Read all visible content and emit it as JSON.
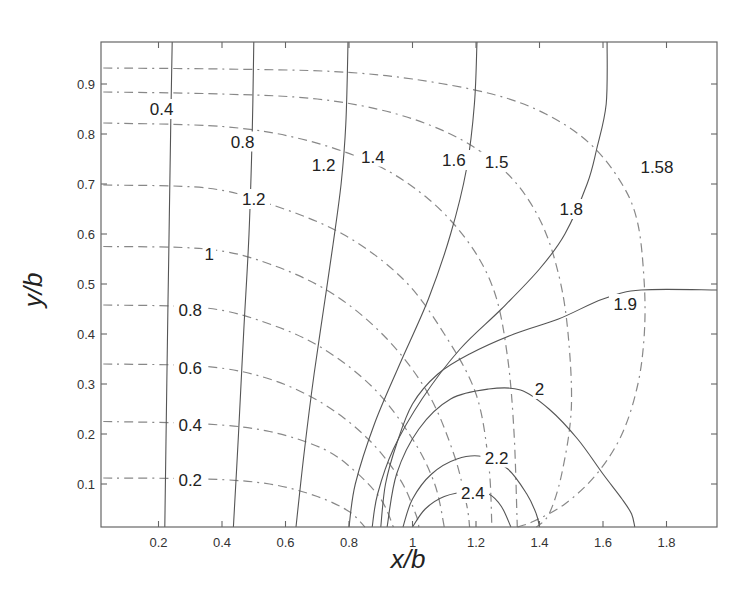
{
  "chart_data": {
    "type": "contour",
    "title": "",
    "xlabel": "x/b",
    "ylabel": "y/b",
    "xlim": [
      0.026,
      1.96
    ],
    "ylim": [
      0.014,
      0.984
    ],
    "grid": false,
    "legend": null,
    "xticks": [
      0.2,
      0.4,
      0.6,
      0.8,
      1,
      1.2,
      1.4,
      1.6,
      1.8
    ],
    "xtick_labels": [
      "0.2",
      "0.4",
      "0.6",
      "0.8",
      "1",
      "1.2",
      "1.4",
      "1.6",
      "1.8"
    ],
    "yticks": [
      0.1,
      0.2,
      0.3,
      0.4,
      0.5,
      0.6,
      0.7,
      0.8,
      0.9
    ],
    "ytick_labels": [
      "0.1",
      "0.2",
      "0.3",
      "0.4",
      "0.5",
      "0.6",
      "0.7",
      "0.8",
      "0.9"
    ],
    "solid_contours": [
      {
        "level": "0.4",
        "points": [
          [
            0.243,
            0.984
          ],
          [
            0.238,
            0.8
          ],
          [
            0.232,
            0.55
          ],
          [
            0.226,
            0.3
          ],
          [
            0.22,
            0.014
          ]
        ],
        "label_at": [
          0.21,
          0.85
        ]
      },
      {
        "level": "0.8",
        "points": [
          [
            0.5,
            0.984
          ],
          [
            0.495,
            0.8
          ],
          [
            0.485,
            0.6
          ],
          [
            0.468,
            0.4
          ],
          [
            0.452,
            0.2
          ],
          [
            0.436,
            0.014
          ]
        ],
        "label_at": [
          0.465,
          0.785
        ]
      },
      {
        "level": "1.2",
        "points": [
          [
            0.797,
            0.984
          ],
          [
            0.79,
            0.82
          ],
          [
            0.775,
            0.7
          ],
          [
            0.75,
            0.58
          ],
          [
            0.72,
            0.45
          ],
          [
            0.69,
            0.32
          ],
          [
            0.66,
            0.17
          ],
          [
            0.633,
            0.014
          ]
        ],
        "label_at": [
          0.72,
          0.738
        ]
      },
      {
        "level": "1.6",
        "points": [
          [
            1.203,
            0.984
          ],
          [
            1.195,
            0.86
          ],
          [
            1.17,
            0.73
          ],
          [
            1.12,
            0.6
          ],
          [
            1.05,
            0.47
          ],
          [
            0.96,
            0.34
          ],
          [
            0.88,
            0.22
          ],
          [
            0.82,
            0.1
          ],
          [
            0.8,
            0.014
          ]
        ],
        "label_at": [
          1.13,
          0.748
        ]
      },
      {
        "level": "1.8",
        "points": [
          [
            1.613,
            0.984
          ],
          [
            1.61,
            0.86
          ],
          [
            1.58,
            0.77
          ],
          [
            1.55,
            0.7
          ],
          [
            1.48,
            0.6
          ],
          [
            1.4,
            0.53
          ],
          [
            1.28,
            0.45
          ],
          [
            1.15,
            0.37
          ],
          [
            1.03,
            0.27
          ],
          [
            0.94,
            0.17
          ],
          [
            0.89,
            0.08
          ],
          [
            0.873,
            0.014
          ]
        ],
        "label_at": [
          1.5,
          0.65
        ]
      },
      {
        "level": "1.9",
        "points": [
          [
            1.96,
            0.488
          ],
          [
            1.72,
            0.488
          ],
          [
            1.6,
            0.47
          ],
          [
            1.46,
            0.43
          ],
          [
            1.32,
            0.4
          ],
          [
            1.18,
            0.36
          ],
          [
            1.08,
            0.32
          ],
          [
            1.0,
            0.26
          ],
          [
            0.95,
            0.18
          ],
          [
            0.915,
            0.1
          ],
          [
            0.9,
            0.014
          ]
        ],
        "label_at": [
          1.67,
          0.46
        ]
      },
      {
        "level": "2",
        "points": [
          [
            0.92,
            0.014
          ],
          [
            0.95,
            0.12
          ],
          [
            1.02,
            0.21
          ],
          [
            1.12,
            0.27
          ],
          [
            1.24,
            0.29
          ],
          [
            1.34,
            0.288
          ],
          [
            1.43,
            0.25
          ],
          [
            1.52,
            0.19
          ],
          [
            1.6,
            0.12
          ],
          [
            1.66,
            0.07
          ],
          [
            1.69,
            0.04
          ],
          [
            1.7,
            0.014
          ]
        ],
        "label_at": [
          1.4,
          0.29
        ]
      },
      {
        "level": "2.2",
        "points": [
          [
            0.97,
            0.014
          ],
          [
            1.0,
            0.07
          ],
          [
            1.06,
            0.12
          ],
          [
            1.14,
            0.15
          ],
          [
            1.22,
            0.155
          ],
          [
            1.3,
            0.13
          ],
          [
            1.36,
            0.08
          ],
          [
            1.39,
            0.04
          ],
          [
            1.4,
            0.014
          ]
        ],
        "label_at": [
          1.265,
          0.153
        ]
      },
      {
        "level": "2.4",
        "points": [
          [
            1.0,
            0.014
          ],
          [
            1.04,
            0.05
          ],
          [
            1.1,
            0.075
          ],
          [
            1.18,
            0.085
          ],
          [
            1.24,
            0.08
          ],
          [
            1.28,
            0.055
          ],
          [
            1.31,
            0.014
          ]
        ],
        "label_at": [
          1.19,
          0.082
        ]
      }
    ],
    "dashed_contours": [
      {
        "level": "0.2",
        "points": [
          [
            0.026,
            0.112
          ],
          [
            0.35,
            0.11
          ],
          [
            0.55,
            0.1
          ],
          [
            0.7,
            0.075
          ],
          [
            0.8,
            0.045
          ],
          [
            0.85,
            0.014
          ]
        ],
        "label_at": [
          0.3,
          0.108
        ]
      },
      {
        "level": "0.4",
        "points": [
          [
            0.026,
            0.225
          ],
          [
            0.35,
            0.22
          ],
          [
            0.55,
            0.205
          ],
          [
            0.72,
            0.17
          ],
          [
            0.82,
            0.125
          ],
          [
            0.9,
            0.07
          ],
          [
            0.94,
            0.014
          ]
        ],
        "label_at": [
          0.3,
          0.218
        ]
      },
      {
        "level": "0.6",
        "points": [
          [
            0.026,
            0.34
          ],
          [
            0.35,
            0.335
          ],
          [
            0.55,
            0.31
          ],
          [
            0.72,
            0.26
          ],
          [
            0.86,
            0.19
          ],
          [
            0.96,
            0.11
          ],
          [
            1.01,
            0.04
          ],
          [
            1.02,
            0.014
          ]
        ],
        "label_at": [
          0.3,
          0.333
        ]
      },
      {
        "level": "0.8",
        "points": [
          [
            0.026,
            0.458
          ],
          [
            0.35,
            0.452
          ],
          [
            0.55,
            0.42
          ],
          [
            0.72,
            0.37
          ],
          [
            0.88,
            0.29
          ],
          [
            1.0,
            0.19
          ],
          [
            1.07,
            0.1
          ],
          [
            1.1,
            0.014
          ]
        ],
        "label_at": [
          0.3,
          0.448
        ]
      },
      {
        "level": "1",
        "points": [
          [
            0.026,
            0.575
          ],
          [
            0.35,
            0.57
          ],
          [
            0.55,
            0.54
          ],
          [
            0.75,
            0.48
          ],
          [
            0.92,
            0.39
          ],
          [
            1.05,
            0.28
          ],
          [
            1.13,
            0.16
          ],
          [
            1.17,
            0.06
          ],
          [
            1.18,
            0.014
          ]
        ],
        "label_at": [
          0.36,
          0.56
        ]
      },
      {
        "level": "1.2",
        "points": [
          [
            0.026,
            0.698
          ],
          [
            0.35,
            0.692
          ],
          [
            0.55,
            0.66
          ],
          [
            0.78,
            0.6
          ],
          [
            0.97,
            0.51
          ],
          [
            1.1,
            0.4
          ],
          [
            1.2,
            0.28
          ],
          [
            1.24,
            0.14
          ],
          [
            1.25,
            0.014
          ]
        ],
        "label_at": [
          0.5,
          0.67
        ]
      },
      {
        "level": "1.4",
        "points": [
          [
            0.026,
            0.822
          ],
          [
            0.4,
            0.815
          ],
          [
            0.65,
            0.79
          ],
          [
            0.88,
            0.74
          ],
          [
            1.05,
            0.67
          ],
          [
            1.18,
            0.58
          ],
          [
            1.26,
            0.48
          ],
          [
            1.3,
            0.35
          ],
          [
            1.32,
            0.2
          ],
          [
            1.33,
            0.014
          ]
        ],
        "label_at": [
          0.875,
          0.755
        ]
      },
      {
        "level": "1.5",
        "points": [
          [
            0.026,
            0.884
          ],
          [
            0.4,
            0.88
          ],
          [
            0.7,
            0.87
          ],
          [
            0.95,
            0.84
          ],
          [
            1.15,
            0.79
          ],
          [
            1.3,
            0.72
          ],
          [
            1.4,
            0.63
          ],
          [
            1.46,
            0.52
          ],
          [
            1.49,
            0.4
          ],
          [
            1.5,
            0.25
          ],
          [
            1.47,
            0.12
          ],
          [
            1.43,
            0.04
          ],
          [
            1.39,
            0.014
          ]
        ],
        "label_at": [
          1.265,
          0.745
        ]
      },
      {
        "level": "1.58",
        "points": [
          [
            0.026,
            0.932
          ],
          [
            0.4,
            0.93
          ],
          [
            0.75,
            0.925
          ],
          [
            1.0,
            0.91
          ],
          [
            1.25,
            0.88
          ],
          [
            1.42,
            0.84
          ],
          [
            1.56,
            0.78
          ],
          [
            1.66,
            0.7
          ],
          [
            1.71,
            0.62
          ],
          [
            1.73,
            0.5
          ],
          [
            1.73,
            0.4
          ],
          [
            1.71,
            0.3
          ],
          [
            1.66,
            0.2
          ],
          [
            1.58,
            0.12
          ],
          [
            1.48,
            0.06
          ],
          [
            1.38,
            0.025
          ],
          [
            1.33,
            0.014
          ]
        ],
        "label_at": [
          1.77,
          0.735
        ]
      }
    ]
  }
}
